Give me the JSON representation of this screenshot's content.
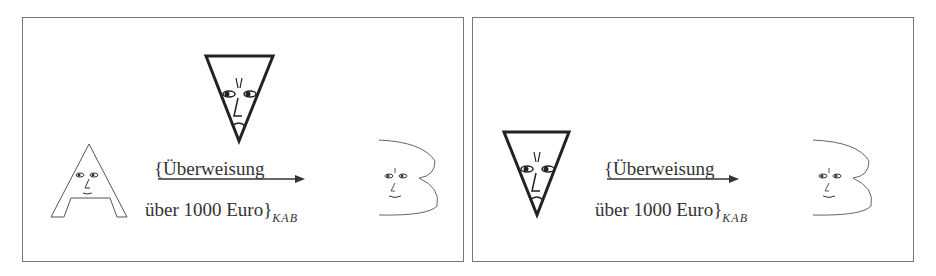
{
  "figure": {
    "panels": [
      {
        "id": "left",
        "actors": [
          "A",
          "Eavesdropper",
          "B"
        ],
        "message": {
          "line1": "{Überweisung",
          "line2": "über 1000 Euro}",
          "key_subscript": "K_AB",
          "key_display": "KAB"
        }
      },
      {
        "id": "right",
        "actors": [
          "Eavesdropper (as sender)",
          "B"
        ],
        "message": {
          "line1": "{Überweisung",
          "line2": "über 1000 Euro}",
          "key_subscript": "K_AB",
          "key_display": "KAB"
        }
      }
    ]
  }
}
